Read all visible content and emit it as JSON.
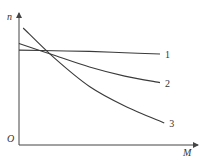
{
  "chart_data": {
    "type": "line",
    "title": "",
    "xlabel": "M",
    "ylabel": "n",
    "origin_label": "O",
    "xlim": [
      0,
      1
    ],
    "ylim": [
      0,
      1
    ],
    "grid": false,
    "legend": "inline labels at right end of each curve",
    "series": [
      {
        "name": "1",
        "x": [
          0,
          0.25,
          0.5,
          0.75,
          1.0
        ],
        "y": [
          0.73,
          0.725,
          0.72,
          0.71,
          0.7
        ]
      },
      {
        "name": "2",
        "x": [
          0,
          0.25,
          0.5,
          0.75,
          1.0
        ],
        "y": [
          0.78,
          0.69,
          0.6,
          0.53,
          0.48
        ]
      },
      {
        "name": "3",
        "x": [
          0.03,
          0.25,
          0.5,
          0.75,
          1.03
        ],
        "y": [
          0.9,
          0.67,
          0.45,
          0.3,
          0.17
        ]
      }
    ]
  }
}
